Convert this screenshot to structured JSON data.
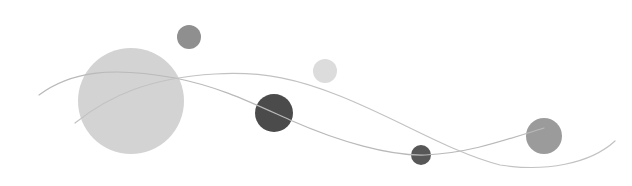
{
  "graphic": {
    "background": "#ffffff",
    "circles": [
      {
        "name": "large-light-circle",
        "cx": 131,
        "cy": 101,
        "r": 53,
        "fill": "#d3d3d3"
      },
      {
        "name": "small-gray-circle-top",
        "cx": 189,
        "cy": 37,
        "r": 12,
        "fill": "#8f8f8f"
      },
      {
        "name": "small-light-circle",
        "cx": 325,
        "cy": 71,
        "r": 12,
        "fill": "#dcdcdc"
      },
      {
        "name": "dark-circle",
        "cx": 274,
        "cy": 113,
        "r": 19,
        "fill": "#4b4b4b"
      },
      {
        "name": "small-dark-circle",
        "cx": 421,
        "cy": 155,
        "r": 10,
        "fill": "#575757"
      },
      {
        "name": "right-gray-circle",
        "cx": 544,
        "cy": 136,
        "r": 18,
        "fill": "#9b9b9b"
      }
    ],
    "curves": [
      {
        "name": "wave-curve-1",
        "d": "M39,95 C70,72 110,66 175,78 C220,87 250,102 290,120 C340,142 390,156 425,155 C470,153 505,140 544,128",
        "stroke": "#b9b9b9"
      },
      {
        "name": "wave-curve-2",
        "d": "M75,123 C110,95 150,78 215,74 C265,71 300,80 340,96 C400,120 450,152 500,165 C545,172 590,164 615,141",
        "stroke": "#c2c2c2"
      }
    ]
  }
}
